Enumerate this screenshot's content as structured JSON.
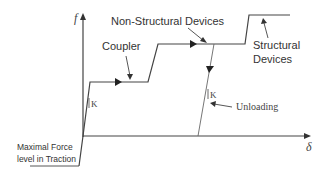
{
  "diagram": {
    "axes": {
      "y_label": "f",
      "x_label": "δ"
    },
    "labels": {
      "coupler": "Coupler",
      "non_structural": "Non-Structural Devices",
      "structural_line1": "Structural",
      "structural_line2": "Devices",
      "unloading": "Unloading",
      "stiffness_1": "K",
      "stiffness_2": "K",
      "max_force_line1": "Maximal Force",
      "max_force_line2": "level in Traction"
    },
    "colors": {
      "line": "#333333",
      "text": "#333333"
    }
  }
}
